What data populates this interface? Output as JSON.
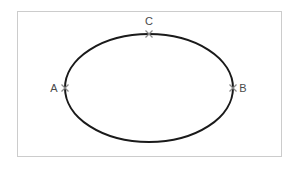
{
  "figure": {
    "title": "",
    "background_color": "#ffffff",
    "frame": {
      "name": "figure-border",
      "x": 17,
      "y": 11,
      "width": 265,
      "height": 146,
      "stroke_color": "#cccccc",
      "stroke_width": 1
    },
    "ellipse": {
      "name": "ellipse-outline",
      "center_x": 149,
      "center_y": 88,
      "radius_x": 84,
      "radius_y": 54,
      "stroke_color": "#1a1a1a",
      "stroke_width": 2,
      "fill": "none"
    },
    "marker": {
      "glyph": "x",
      "color": "#8a8a8a",
      "size": 7
    },
    "points": [
      {
        "id": "A",
        "label": "A",
        "marker_x": 65,
        "marker_y": 88,
        "label_x": 54,
        "label_y": 92,
        "position": "left-vertex"
      },
      {
        "id": "B",
        "label": "B",
        "marker_x": 233,
        "marker_y": 88,
        "label_x": 238,
        "label_y": 92,
        "position": "right-vertex"
      },
      {
        "id": "C",
        "label": "C",
        "marker_x": 149,
        "marker_y": 34,
        "label_x": 149,
        "label_y": 25,
        "position": "top-vertex"
      }
    ]
  }
}
